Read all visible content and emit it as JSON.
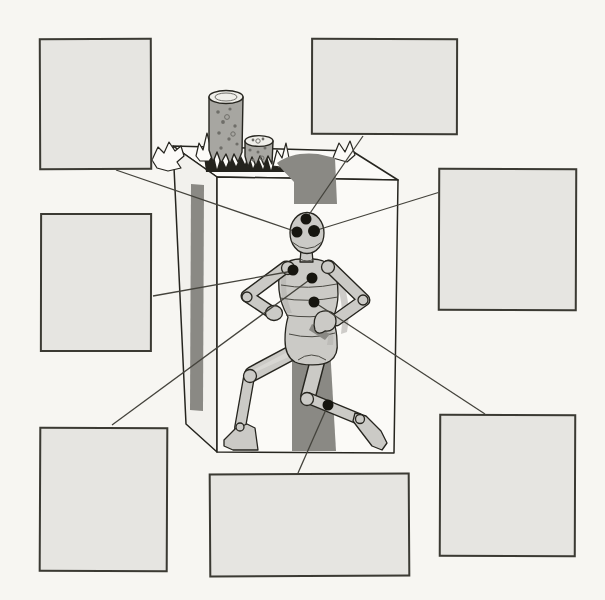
{
  "colors": {
    "bg": "#f7f6f2",
    "ink": "#26251f",
    "line": "#44433c",
    "dot": "#16150f",
    "callout-fill": "#e6e5e1",
    "callout-border": "#3b3a33",
    "carton-face": "#fbfaf7",
    "carton-side": "#f2f1ed",
    "accent-dark": "#8a8984",
    "torn-dark": "#24231d",
    "flap-fill": "#fcfbf8",
    "log-body": "#a7a6a1",
    "log-top": "#efeee9",
    "speckle": "#6f6e69",
    "fig-fill": "#cbcac6",
    "fig-shade": "#b5b4b0",
    "fig-light": "#d9d8d4"
  },
  "illustration": {
    "subject": "artist mannequin posed inside a torn-open carton with two speckled logs on top",
    "callout_count": 7,
    "marker_count": 7
  },
  "callouts": [
    {
      "id": "top-left",
      "label": ""
    },
    {
      "id": "top-right",
      "label": ""
    },
    {
      "id": "right-middle",
      "label": ""
    },
    {
      "id": "left-middle",
      "label": ""
    },
    {
      "id": "bottom-left",
      "label": ""
    },
    {
      "id": "bottom-center",
      "label": ""
    },
    {
      "id": "bottom-right",
      "label": ""
    }
  ],
  "markers": [
    {
      "name": "head-top",
      "connects_to": "top-right"
    },
    {
      "name": "left-eye",
      "connects_to": "top-left"
    },
    {
      "name": "right-eye",
      "connects_to": "right-middle"
    },
    {
      "name": "left-chest",
      "connects_to": "left-middle"
    },
    {
      "name": "center-chest",
      "connects_to": "bottom-left"
    },
    {
      "name": "abdomen",
      "connects_to": "bottom-right"
    },
    {
      "name": "right-shin",
      "connects_to": "bottom-center"
    }
  ]
}
